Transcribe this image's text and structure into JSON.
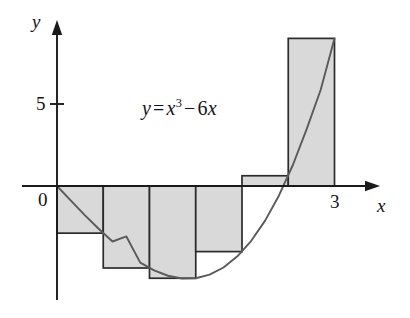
{
  "figure": {
    "equation": {
      "lhs": "y",
      "equals": "=",
      "var1": "x",
      "exponent": "3",
      "minus": "−",
      "coefficient": "6",
      "var2": "x",
      "full_text": "y = x³ − 6x"
    },
    "axis_label_x": "x",
    "axis_label_y": "y",
    "origin_label": "0",
    "colors": {
      "curve": "#5a5a5a",
      "axis": "#1a1a1a",
      "rect_fill": "#d9d9d9",
      "rect_stroke": "#2b2b2b",
      "text": "#141414",
      "background": "#ffffff"
    }
  },
  "chart_data": {
    "type": "bar",
    "title": "",
    "subtitle": "",
    "xlabel": "x",
    "ylabel": "y",
    "function": "y = x^3 - 6x",
    "annotations": [
      "y = x³ − 6x"
    ],
    "grid": false,
    "legend": null,
    "xlim": [
      -0.15,
      3.45
    ],
    "ylim": [
      -7.0,
      10.2
    ],
    "xticks": [
      0,
      3
    ],
    "xtick_labels": [
      "0",
      "3"
    ],
    "yticks": [
      5
    ],
    "ytick_labels": [
      "5"
    ],
    "riemann": {
      "method": "right-endpoint",
      "interval": [
        0,
        3
      ],
      "n": 6,
      "dx": 0.5,
      "edges": [
        0,
        0.5,
        1.0,
        1.5,
        2.0,
        2.5,
        3.0
      ],
      "sample_points": [
        0.5,
        1.0,
        1.5,
        2.0,
        2.5,
        3.0
      ]
    },
    "categories": [
      "0–0.5",
      "0.5–1",
      "1–1.5",
      "1.5–2",
      "2–2.5",
      "2.5–3"
    ],
    "values": [
      -2.875,
      -5,
      -5.625,
      -4,
      0.625,
      9
    ],
    "curve": {
      "type": "line",
      "x": [
        0,
        0.15,
        0.3,
        0.45,
        0.6,
        0.75,
        0.9,
        1.05,
        1.2,
        1.35,
        1.5,
        1.65,
        1.8,
        1.95,
        2.1,
        2.25,
        2.4,
        2.55,
        2.7,
        2.85,
        3
      ],
      "y": [
        0,
        -0.897,
        -1.773,
        -2.609,
        -3.384,
        -3.078,
        -4.671,
        -5.142,
        -5.472,
        -5.639,
        -5.625,
        -5.407,
        -4.968,
        -4.286,
        -3.339,
        -2.109,
        -0.576,
        1.28,
        3.483,
        5.852,
        9
      ]
    }
  }
}
